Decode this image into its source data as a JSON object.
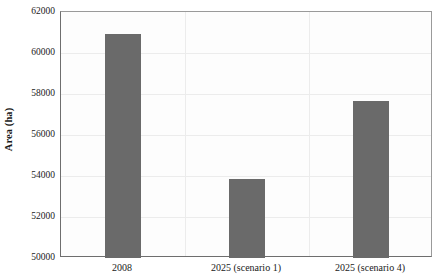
{
  "chart_data": {
    "type": "bar",
    "title": "",
    "subtitle": "",
    "xlabel": "",
    "ylabel": "Area (ha)",
    "categories": [
      "2008",
      "2025 (scenario 1)",
      "2025 (scenario 4)"
    ],
    "values": [
      60950,
      53880,
      57650
    ],
    "series": [
      {
        "name": "Area",
        "values": [
          60950,
          53880,
          57650
        ]
      }
    ],
    "ylim": [
      50000,
      62000
    ],
    "y_ticks": [
      50000,
      52000,
      54000,
      56000,
      58000,
      60000,
      62000
    ],
    "y_tick_labels": [
      "50000",
      "52000",
      "54000",
      "56000",
      "58000",
      "60000",
      "62000"
    ],
    "grid": true,
    "grid_axis": "both",
    "legend": false,
    "legend_position": "none",
    "annotations": [],
    "bar_color": "#6a6a6a",
    "plot_background": "#fdfdfd",
    "gridline_color": "#ececec",
    "axis_color": "#6e6e6e"
  }
}
